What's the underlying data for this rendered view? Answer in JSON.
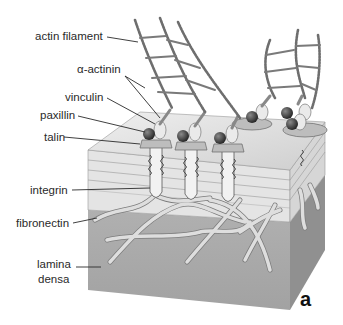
{
  "figure": {
    "panel_label": "a",
    "colors": {
      "background": "#ffffff",
      "block_front": "#a8a8a8",
      "block_side": "#8f8f8f",
      "block_top": "#dcdcdc",
      "membrane_layers": "#e6e6e6",
      "fibers": "#d4d4d4",
      "actin": "#7a7a7a",
      "talin_ball": "#3a3a3a",
      "leader_lines": "#2a2a2a"
    },
    "labels": {
      "actin_filament": "actin filament",
      "alpha_actinin": "α-actinin",
      "vinculin": "vinculin",
      "paxillin": "paxillin",
      "talin": "talin",
      "integrin": "integrin",
      "fibronectin": "fibronectin",
      "lamina_densa_line1": "lamina",
      "lamina_densa_line2": "densa"
    }
  }
}
